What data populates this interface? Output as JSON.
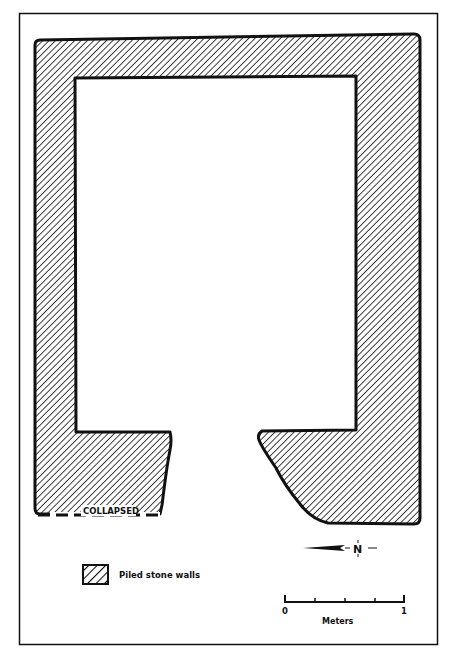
{
  "diagram": {
    "type": "archaeological-site-plan",
    "wall_label": "COLLAPSED",
    "north_label": "N",
    "legend": {
      "swatch_pattern": "diagonal-hatch",
      "label": "Piled stone walls"
    },
    "scale_bar": {
      "start_label": "0",
      "end_label": "1",
      "unit_label": "Meters",
      "ticks": 5
    },
    "colors": {
      "ink": "#111111",
      "paper": "#ffffff"
    }
  }
}
